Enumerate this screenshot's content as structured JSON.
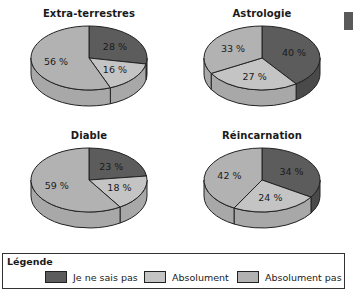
{
  "colors": {
    "je_ne_sais_pas": "#5c5c5c",
    "absolument": "#c4c4c4",
    "absolument_pas": "#b2b2b2",
    "side_dark": "#4a4a4a",
    "side_light": "#a8a8a8",
    "outline": "#222222"
  },
  "legend": {
    "title": "Légende",
    "items": [
      {
        "label": "Je ne sais pas",
        "color": "#5c5c5c"
      },
      {
        "label": "Absolument",
        "color": "#c4c4c4"
      },
      {
        "label": "Absolument pas",
        "color": "#b2b2b2"
      }
    ]
  },
  "charts": [
    {
      "title": "Extra-terrestres",
      "labels": [
        "28 %",
        "16 %",
        "56 %"
      ]
    },
    {
      "title": "Astrologie",
      "labels": [
        "40 %",
        "27 %",
        "33 %"
      ]
    },
    {
      "title": "Diable",
      "labels": [
        "23 %",
        "18 %",
        "59 %"
      ]
    },
    {
      "title": "Réincarnation",
      "labels": [
        "34 %",
        "24 %",
        "42 %"
      ]
    }
  ],
  "chart_data": [
    {
      "type": "pie",
      "title": "Extra-terrestres",
      "categories": [
        "Je ne sais pas",
        "Absolument",
        "Absolument pas"
      ],
      "values": [
        28,
        16,
        56
      ],
      "unit": "%"
    },
    {
      "type": "pie",
      "title": "Astrologie",
      "categories": [
        "Je ne sais pas",
        "Absolument",
        "Absolument pas"
      ],
      "values": [
        40,
        27,
        33
      ],
      "unit": "%"
    },
    {
      "type": "pie",
      "title": "Diable",
      "categories": [
        "Je ne sais pas",
        "Absolument",
        "Absolument pas"
      ],
      "values": [
        23,
        18,
        59
      ],
      "unit": "%"
    },
    {
      "type": "pie",
      "title": "Réincarnation",
      "categories": [
        "Je ne sais pas",
        "Absolument",
        "Absolument pas"
      ],
      "values": [
        34,
        24,
        42
      ],
      "unit": "%"
    }
  ]
}
